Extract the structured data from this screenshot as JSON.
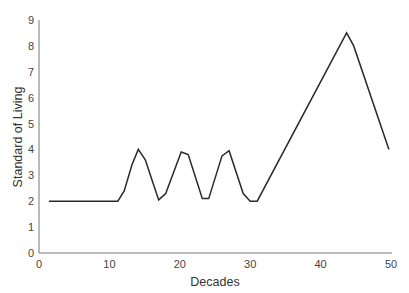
{
  "chart_data": {
    "type": "line",
    "title": "",
    "xlabel": "Decades",
    "ylabel": "Standard of Living",
    "xlim": [
      0,
      50
    ],
    "ylim": [
      0,
      9
    ],
    "xticks": [
      0,
      10,
      20,
      30,
      40,
      50
    ],
    "yticks": [
      0,
      1,
      2,
      3,
      4,
      5,
      6,
      7,
      8,
      9
    ],
    "grid": false,
    "legend": null,
    "series": [
      {
        "name": "Standard of Living",
        "color": "#2a2a2a",
        "x": [
          1.4,
          11.2,
          12.1,
          13.2,
          14.1,
          15.1,
          16.2,
          17.0,
          18.0,
          20.2,
          21.2,
          23.2,
          24.1,
          26.0,
          27.0,
          29.0,
          30.0,
          31.0,
          43.7,
          44.7,
          49.7
        ],
        "y": [
          2.0,
          2.0,
          2.4,
          3.4,
          4.0,
          3.6,
          2.7,
          2.05,
          2.3,
          3.9,
          3.8,
          2.1,
          2.1,
          3.75,
          3.95,
          2.3,
          2.0,
          2.0,
          8.5,
          8.0,
          4.0
        ]
      }
    ]
  },
  "labels": {
    "xlabel": "Decades",
    "ylabel": "Standard of Living"
  }
}
